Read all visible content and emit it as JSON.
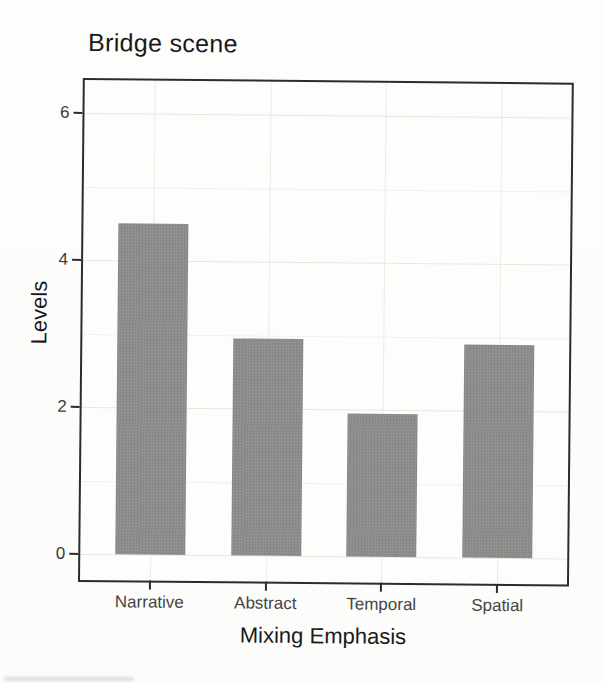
{
  "chart_data": {
    "type": "bar",
    "title": "Bridge scene",
    "categories": [
      "Narrative",
      "Abstract",
      "Temporal",
      "Spatial"
    ],
    "values": [
      4.5,
      2.95,
      1.95,
      2.9
    ],
    "xlabel": "Mixing Emphasis",
    "ylabel": "Levels",
    "ylim": [
      -0.35,
      6.45
    ],
    "yticks": [
      0,
      2,
      4,
      6
    ],
    "minor_yticks": [
      1,
      3,
      5
    ],
    "legend": "none",
    "grid": "faint major and minor horizontal lines, faint vertical lines at category centers",
    "bar_color": "#8e8d8b",
    "panel_border_color": "#2e2c2a",
    "background_color": "#fdfdfc",
    "text_color": "#1a1a1a"
  }
}
